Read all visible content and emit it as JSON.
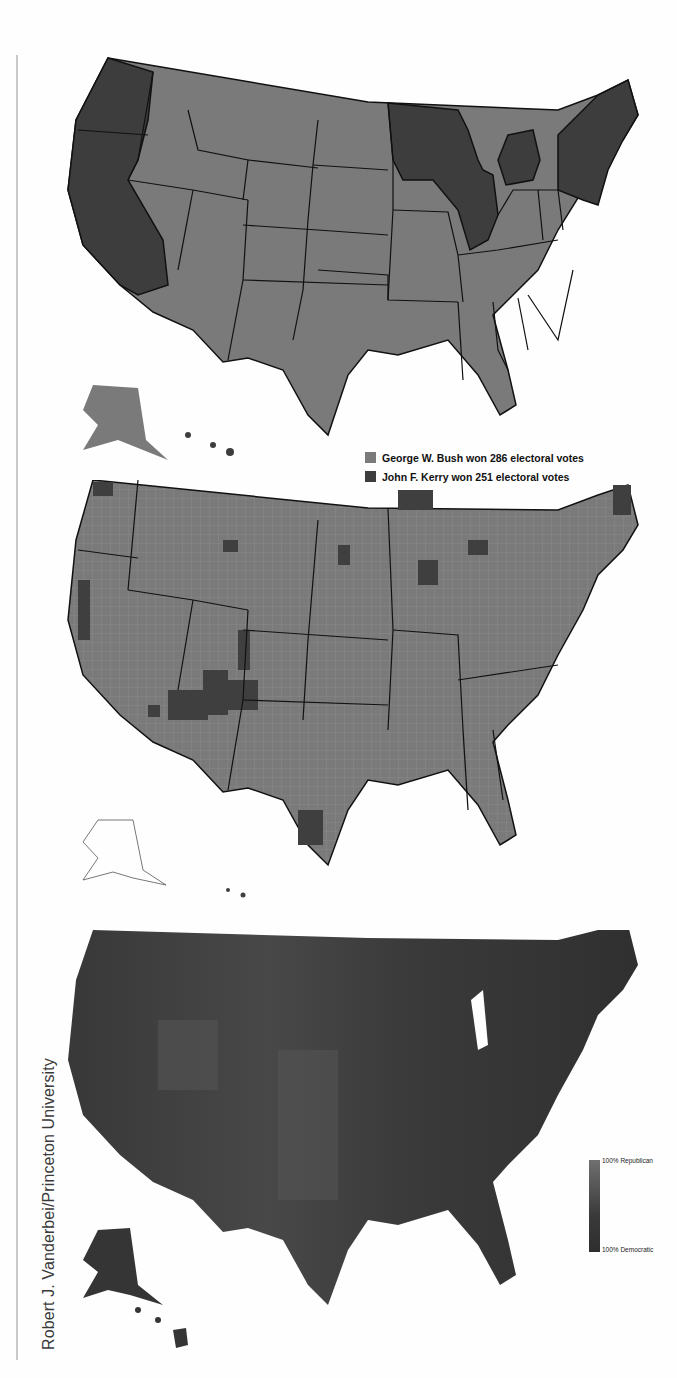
{
  "page": {
    "credit": "Robert J. Vanderbei/Princeton University"
  },
  "map_state_results": {
    "title": "2004 Presidential election results by state",
    "legend": [
      {
        "label": "George W. Bush won 286 electoral votes",
        "color": "#7a7a7a"
      },
      {
        "label": "John F. Kerry won 251 electoral votes",
        "color": "#3d3d3d"
      }
    ],
    "colors": {
      "bush": "#7a7a7a",
      "kerry": "#3d3d3d",
      "border": "#111111"
    }
  },
  "map_county_results": {
    "title": "2004 Presidential election results by county",
    "colors": {
      "bush": "#7a7a7a",
      "kerry": "#3f3f3f",
      "county_border": "#9a9a9a",
      "state_border": "#111111"
    }
  },
  "map_county_gradient": {
    "title": "2004 county results on a Republican-Democratic gradient",
    "legend": {
      "top_label": "100% Republican",
      "bottom_label": "100% Democratic"
    },
    "colors": {
      "republican": "#707070",
      "democratic": "#2e2e2e"
    }
  }
}
